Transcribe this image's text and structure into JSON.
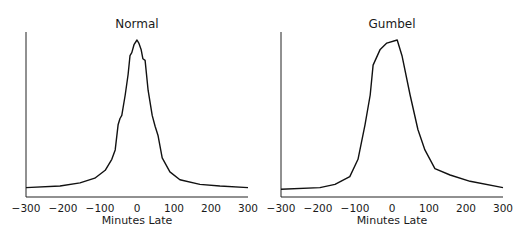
{
  "chart_data": [
    {
      "type": "line",
      "title": "Normal",
      "xlabel": "Minutes Late",
      "ylabel": "",
      "xlim": [
        -300,
        300
      ],
      "xticks": [
        -300,
        -200,
        -100,
        0,
        100,
        200,
        300
      ],
      "xtick_labels": [
        "−300",
        "−200",
        "−100",
        "0",
        "100",
        "200",
        "300"
      ],
      "yticks": [],
      "grid": false,
      "legend": null,
      "y_unit": "relative density (peak = 1)",
      "x": [
        -300,
        -208,
        -154,
        -114,
        -86,
        -68,
        -59,
        -51,
        -46,
        -41,
        -32,
        -24,
        -19,
        -14,
        -8,
        0,
        5,
        11,
        16,
        22,
        30,
        41,
        49,
        57,
        68,
        89,
        116,
        170,
        224,
        300
      ],
      "y": [
        0.06,
        0.07,
        0.09,
        0.12,
        0.17,
        0.24,
        0.3,
        0.46,
        0.5,
        0.52,
        0.65,
        0.78,
        0.9,
        0.92,
        0.97,
        1.0,
        0.98,
        0.94,
        0.88,
        0.87,
        0.68,
        0.52,
        0.45,
        0.39,
        0.25,
        0.16,
        0.11,
        0.08,
        0.07,
        0.06
      ]
    },
    {
      "type": "line",
      "title": "Gumbel",
      "xlabel": "Minutes Late",
      "ylabel": "",
      "xlim": [
        -300,
        300
      ],
      "xticks": [
        -300,
        -200,
        -100,
        0,
        100,
        200,
        300
      ],
      "xtick_labels": [
        "−300",
        "−200",
        "−100",
        "0",
        "100",
        "200",
        "300"
      ],
      "yticks": [],
      "grid": false,
      "legend": null,
      "y_unit": "relative density (peak = 1)",
      "x": [
        -300,
        -195,
        -154,
        -114,
        -92,
        -73,
        -59,
        -51,
        -32,
        -14,
        14,
        27,
        49,
        70,
        89,
        116,
        157,
        211,
        300
      ],
      "y": [
        0.05,
        0.06,
        0.08,
        0.13,
        0.24,
        0.46,
        0.65,
        0.84,
        0.94,
        0.98,
        1.0,
        0.9,
        0.65,
        0.43,
        0.3,
        0.18,
        0.14,
        0.1,
        0.06
      ]
    }
  ]
}
